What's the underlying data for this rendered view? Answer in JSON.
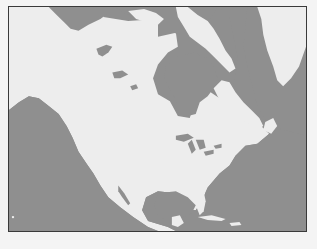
{
  "map": {
    "region": "North America",
    "style": "grayscale outline map",
    "colors": {
      "water": "#8f8f8f",
      "land": "#ededed",
      "border": "#3a3a3a",
      "background": "#f4f4f4"
    },
    "features": [
      "Pacific Ocean",
      "Atlantic Ocean",
      "Arctic Ocean",
      "Hudson Bay",
      "Greenland",
      "Great Lakes",
      "Gulf of Mexico",
      "Caribbean Sea",
      "Gulf of California",
      "Canadian Arctic Archipelago"
    ]
  }
}
